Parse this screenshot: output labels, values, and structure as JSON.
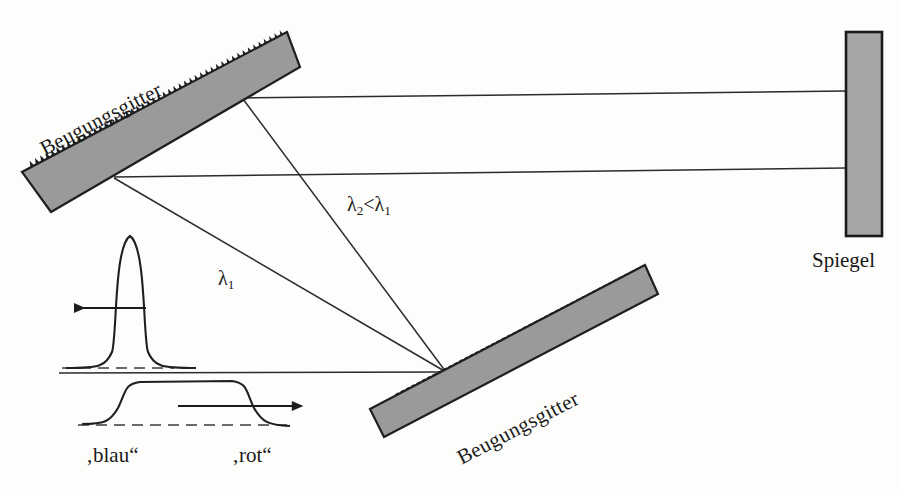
{
  "diagram": {
    "colors": {
      "grating_fill": "#9a9a9a",
      "grating_stroke": "#1f1f1f",
      "mirror_fill": "#a6a6a6",
      "mirror_stroke": "#1a1a1a",
      "ray_stroke": "#2b2b2b",
      "background": "#fdfdfb",
      "dashed_baseline": "#3a3a3a"
    },
    "components": [
      {
        "id": "grating-top",
        "name": "Beugungsgitter",
        "label": "Beugungsgitter",
        "angle_deg": -27.5,
        "teeth_edge": "lower-right"
      },
      {
        "id": "grating-bottom",
        "name": "Beugungsgitter",
        "label": "Beugungsgitter",
        "angle_deg": -27.5,
        "teeth_edge": "upper-left"
      },
      {
        "id": "mirror",
        "name": "Spiegel",
        "label": "Spiegel",
        "orientation": "vertical"
      }
    ],
    "ray_labels": {
      "lambda1": "λ",
      "lambda1_sub": "1",
      "lambda2_expr_left": "λ",
      "lambda2_sub": "2",
      "lambda2_relation": "<",
      "lambda2_expr_right": "λ",
      "lambda1_sub_right": "1"
    },
    "pulses": [
      {
        "id": "pulse-short",
        "shape": "narrow-gaussian",
        "arrow_direction": "left",
        "description": "short intense pulse before stretching"
      },
      {
        "id": "pulse-stretched",
        "shape": "flat-top-chirped",
        "arrow_direction": "right",
        "description": "stretched chirped pulse, blue leading / red trailing"
      }
    ],
    "pulse_labels": {
      "blue": "‚blau“",
      "red": "‚rot“"
    }
  }
}
